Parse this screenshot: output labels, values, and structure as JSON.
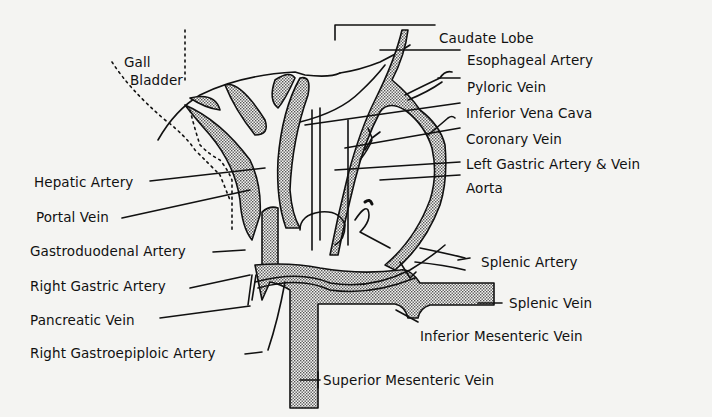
{
  "figure": {
    "type": "anatomical-diagram",
    "colors": {
      "background": "#f4f4f2",
      "ink": "#111111",
      "stipple": "#9a9a9a"
    }
  },
  "labels": {
    "left": [
      {
        "id": "gall_bladder_1",
        "text": "Gall"
      },
      {
        "id": "gall_bladder_2",
        "text": "Bladder"
      },
      {
        "id": "hepatic_artery",
        "text": "Hepatic Artery"
      },
      {
        "id": "portal_vein",
        "text": "Portal Vein"
      },
      {
        "id": "gastroduodenal_artery",
        "text": "Gastroduodenal Artery"
      },
      {
        "id": "right_gastric_artery",
        "text": "Right Gastric Artery"
      },
      {
        "id": "pancreatic_vein",
        "text": "Pancreatic Vein"
      },
      {
        "id": "right_gastroepiploic_artery",
        "text": "Right Gastroepiploic Artery"
      }
    ],
    "right": [
      {
        "id": "caudate_lobe",
        "text": "Caudate Lobe"
      },
      {
        "id": "esophageal_artery",
        "text": "Esophageal Artery"
      },
      {
        "id": "pyloric_vein",
        "text": "Pyloric Vein"
      },
      {
        "id": "inferior_vena_cava",
        "text": "Inferior Vena Cava"
      },
      {
        "id": "coronary_vein",
        "text": "Coronary Vein"
      },
      {
        "id": "left_gastric_artery_vein",
        "text": "Left Gastric Artery & Vein"
      },
      {
        "id": "aorta",
        "text": "Aorta"
      },
      {
        "id": "splenic_artery",
        "text": "Splenic Artery"
      },
      {
        "id": "splenic_vein",
        "text": "Splenic Vein"
      },
      {
        "id": "inferior_mesenteric_vein",
        "text": "Inferior Mesenteric  Vein"
      },
      {
        "id": "superior_mesenteric_vein",
        "text": "Superior Mesenteric Vein"
      }
    ]
  }
}
